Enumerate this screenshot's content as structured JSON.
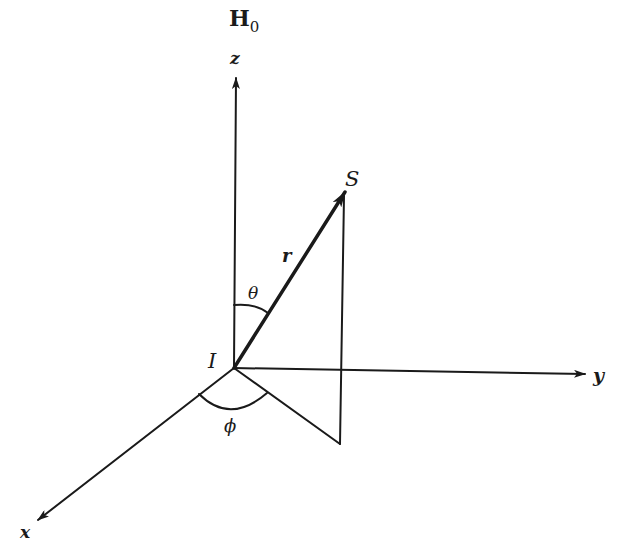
{
  "diagram": {
    "type": "spherical-coordinates",
    "field": {
      "label_main": "H",
      "label_sub": "0"
    },
    "origin_label": "I",
    "point_label": "S",
    "radius_label": "r",
    "polar_angle_label": "θ",
    "azimuth_angle_label": "ϕ",
    "axes": [
      {
        "name": "z",
        "label": "z"
      },
      {
        "name": "y",
        "label": "y"
      },
      {
        "name": "x",
        "label": "x"
      }
    ]
  }
}
